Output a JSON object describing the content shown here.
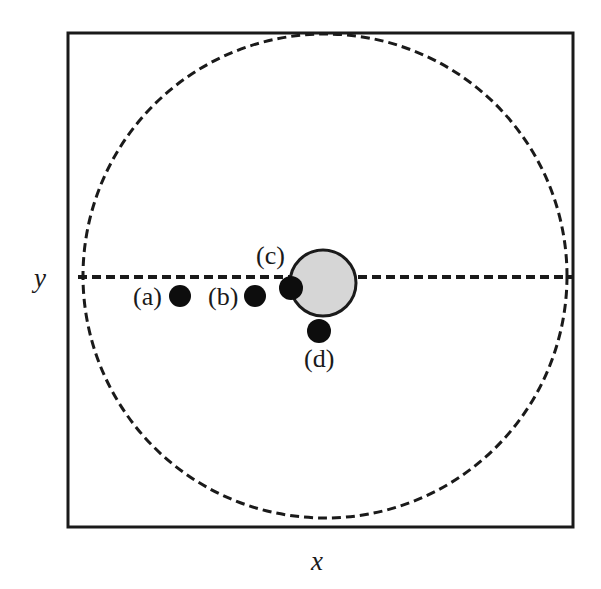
{
  "figure": {
    "type": "schematic-diagram",
    "background_color": "#ffffff",
    "frame": {
      "name": "plot-frame",
      "x": 68,
      "y": 33,
      "width": 505,
      "height": 494,
      "stroke_color": "#1a1a1a",
      "stroke_width": 3,
      "fill": "#ffffff"
    },
    "dashed_circle": {
      "name": "dashed-boundary-circle",
      "cx": 325,
      "cy": 276,
      "r": 242,
      "stroke_color": "#1a1a1a",
      "stroke_width": 3,
      "dash_pattern": "9 5",
      "fill": "none"
    },
    "dashed_axis_line": {
      "name": "horizontal-dashed-axis",
      "x1": 78,
      "y1": 277,
      "x2": 573,
      "y2": 277,
      "stroke_color": "#1a1a1a",
      "stroke_width": 4,
      "dash_pattern": "9 5"
    },
    "gray_disk": {
      "name": "gray-disk",
      "cx": 323,
      "cy": 283,
      "r": 33,
      "fill_color": "#d6d6d6",
      "stroke_color": "#1a1a1a",
      "stroke_width": 3
    },
    "markers": [
      {
        "id": "a",
        "label": "(a)",
        "cx": 180,
        "cy": 296,
        "r": 11,
        "fill_color": "#0d0d0d",
        "label_x": 133,
        "label_y": 305,
        "label_anchor": "start"
      },
      {
        "id": "b",
        "label": "(b)",
        "cx": 255,
        "cy": 296,
        "r": 11,
        "fill_color": "#0d0d0d",
        "label_x": 208,
        "label_y": 305,
        "label_anchor": "start"
      },
      {
        "id": "c",
        "label": "(c)",
        "cx": 291,
        "cy": 288,
        "r": 12,
        "fill_color": "#0d0d0d",
        "label_x": 256,
        "label_y": 264,
        "label_anchor": "start"
      },
      {
        "id": "d",
        "label": "(d)",
        "cx": 319,
        "cy": 331,
        "r": 12,
        "fill_color": "#0d0d0d",
        "label_x": 304,
        "label_y": 367,
        "label_anchor": "start"
      }
    ],
    "axes": {
      "y_label": {
        "name": "y-axis-label",
        "text": "y",
        "x": 34,
        "y": 287
      },
      "x_label": {
        "name": "x-axis-label",
        "text": "x",
        "x": 311,
        "y": 570
      }
    }
  }
}
